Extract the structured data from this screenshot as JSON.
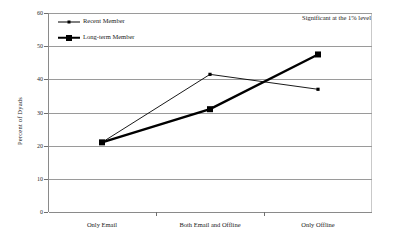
{
  "chart_data": {
    "type": "line",
    "title": "",
    "subtitle": "",
    "xlabel": "",
    "ylabel": "Percent of Dyads",
    "categories": [
      "Only Email",
      "Both Email and Offline",
      "Only Offline"
    ],
    "series": [
      {
        "name": "Recent Member",
        "values": [
          21,
          41.5,
          37
        ],
        "marker": "square-small",
        "line_style": "thin",
        "color": "#000000"
      },
      {
        "name": "Long-term Member",
        "values": [
          21,
          31,
          47.5
        ],
        "marker": "square-large",
        "line_style": "thick",
        "color": "#000000"
      }
    ],
    "ylim": [
      0,
      60
    ],
    "yticks": [
      0,
      10,
      20,
      30,
      40,
      50,
      60
    ],
    "ytick_labels": [
      "0",
      "10",
      "20",
      "30",
      "40",
      "50",
      "60"
    ],
    "grid": true,
    "grid_axis": "y",
    "legend_position": "top-left",
    "annotations": [
      {
        "text": "Significant at the 1% level",
        "position": "top-right"
      }
    ]
  },
  "legend": {
    "items": [
      {
        "label": "Recent Member"
      },
      {
        "label": "Long-term Member"
      }
    ]
  },
  "annotation": {
    "significance_note": "Significant at the 1% level"
  },
  "axes": {
    "y_title": "Percent of Dyads"
  },
  "colors": {
    "series_ink": "#000000",
    "gridline": "#9a9a9a",
    "axis": "#8a8a8a",
    "background": "#ffffff"
  }
}
